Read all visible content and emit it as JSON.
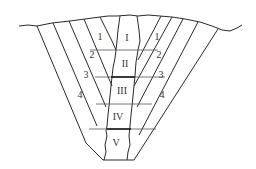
{
  "diagram": {
    "center_blocks": [
      {
        "label": "I",
        "x": 127,
        "y": 37
      },
      {
        "label": "II",
        "x": 128,
        "y": 64
      },
      {
        "label": "III",
        "x": 125,
        "y": 93
      },
      {
        "label": "IV",
        "x": 118,
        "y": 122
      },
      {
        "label": "V",
        "x": 114,
        "y": 150
      }
    ],
    "left_layers": [
      {
        "label": "1",
        "x": 100,
        "y": 36
      },
      {
        "label": "2",
        "x": 91,
        "y": 54
      },
      {
        "label": "3",
        "x": 85,
        "y": 75
      },
      {
        "label": "4",
        "x": 80,
        "y": 96
      }
    ],
    "right_layers": [
      {
        "label": "1",
        "x": 157,
        "y": 36
      },
      {
        "label": "2",
        "x": 159,
        "y": 54
      },
      {
        "label": "3",
        "x": 160,
        "y": 75
      },
      {
        "label": "4",
        "x": 163,
        "y": 96
      }
    ]
  }
}
